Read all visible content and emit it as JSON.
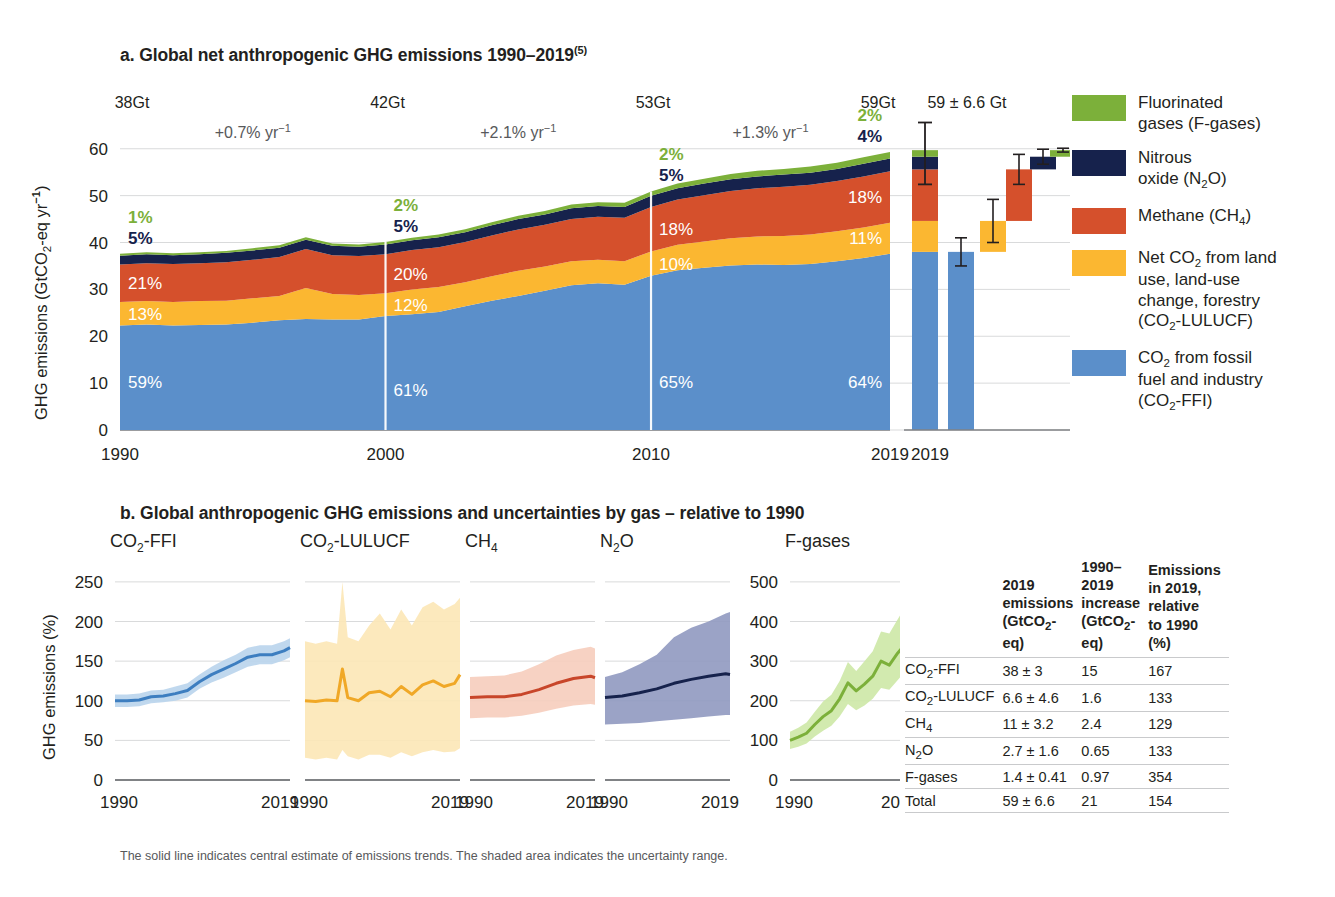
{
  "figure": {
    "panel_a": {
      "title": "a. Global net anthropogenic GHG emissions 1990–2019",
      "title_sup": "(5)",
      "ylabel_pre": "GHG emissions (GtCO",
      "ylabel_sub": "2",
      "ylabel_post": "-eq yr",
      "ylabel_sup": "−1",
      "ylabel_close": ")",
      "y_ticks": [
        "60",
        "50",
        "40",
        "30",
        "20",
        "10",
        "0"
      ],
      "x_ticks": [
        "1990",
        "2000",
        "2010",
        "2019"
      ],
      "totals": [
        {
          "year": "1990",
          "label": "38Gt"
        },
        {
          "year": "2000",
          "label": "42Gt"
        },
        {
          "year": "2010",
          "label": "53Gt"
        },
        {
          "year": "2019",
          "label": "59Gt"
        }
      ],
      "growth_rates": [
        {
          "label": "+0.7% yr",
          "sup": "−1"
        },
        {
          "label": "+2.1% yr",
          "sup": "−1"
        },
        {
          "label": "+1.3% yr",
          "sup": "−1"
        }
      ],
      "share_labels": {
        "1990": {
          "fgases": "1%",
          "n2o": "5%",
          "ch4": "21%",
          "lulucf": "13%",
          "ffi": "59%"
        },
        "2000": {
          "fgases": "2%",
          "n2o": "5%",
          "ch4": "20%",
          "lulucf": "12%",
          "ffi": "61%"
        },
        "2010": {
          "fgases": "2%",
          "n2o": "5%",
          "ch4": "18%",
          "lulucf": "10%",
          "ffi": "65%"
        },
        "2019": {
          "fgases": "2%",
          "n2o": "4%",
          "ch4": "18%",
          "lulucf": "11%",
          "ffi": "64%"
        }
      },
      "bar_panel": {
        "headline": "59 ± 6.6 Gt",
        "x_tick": "2019"
      }
    },
    "panel_b": {
      "title": "b. Global anthropogenic GHG emissions and uncertainties by gas – relative to 1990",
      "ylabel_text": "GHG emissions (%)",
      "subplots": [
        {
          "name": "CO2-FFI",
          "title_pre": "CO",
          "title_sub": "2",
          "title_post": "-FFI",
          "y_ticks": [
            "250",
            "200",
            "150",
            "100",
            "50",
            "0"
          ],
          "x_ticks": [
            "1990",
            "2019"
          ]
        },
        {
          "name": "CO2-LULUCF",
          "title_pre": "CO",
          "title_sub": "2",
          "title_post": "-LULUCF",
          "x_ticks": [
            "1990",
            "2019"
          ]
        },
        {
          "name": "CH4",
          "title_pre": "CH",
          "title_sub": "4",
          "title_post": "",
          "x_ticks": [
            "1990",
            "2019"
          ]
        },
        {
          "name": "N2O",
          "title_pre": "N",
          "title_sub": "2",
          "title_post": "O",
          "x_ticks": [
            "1990",
            "2019"
          ]
        },
        {
          "name": "F-gases",
          "title_pre": "F-gases",
          "title_sub": "",
          "title_post": "",
          "y_ticks": [
            "500",
            "400",
            "300",
            "200",
            "100",
            "0"
          ],
          "x_ticks": [
            "1990",
            "2019"
          ]
        }
      ]
    },
    "legend": [
      {
        "key": "fgases",
        "color": "#7cb03a",
        "line1": "Fluorinated",
        "line2": "gases (F-gases)",
        "line3": "",
        "line4": ""
      },
      {
        "key": "n2o",
        "color": "#16224c",
        "line1": "Nitrous",
        "line2": "oxide (N₂O)",
        "line3": "",
        "line4": ""
      },
      {
        "key": "ch4",
        "color": "#d5502c",
        "line1": "Methane (CH₄)",
        "line2": "",
        "line3": "",
        "line4": ""
      },
      {
        "key": "lulucf",
        "color": "#fbb731",
        "line1": "Net CO₂ from land",
        "line2": "use, land-use",
        "line3": "change, forestry",
        "line4": "(CO₂-LULUCF)"
      },
      {
        "key": "ffi",
        "color": "#5b8fca",
        "line1": "CO₂ from fossil",
        "line2": "fuel and industry",
        "line3": "(CO₂-FFI)",
        "line4": ""
      }
    ],
    "table": {
      "headers": [
        "",
        "2019 emissions (GtCO₂-eq)",
        "1990–2019 increase (GtCO₂-eq)",
        "Emissions in 2019, relative to 1990 (%)"
      ],
      "header_lines": [
        [
          ""
        ],
        [
          "2019",
          "emissions",
          "(GtCO₂-eq)"
        ],
        [
          "1990–2019",
          "increase",
          "(GtCO₂-eq)"
        ],
        [
          "Emissions",
          "in 2019,",
          "relative",
          "to 1990 (%)"
        ]
      ],
      "rows": [
        {
          "gas": "CO₂-FFI",
          "emissions_2019": "38 ± 3",
          "increase": "15",
          "relative": "167"
        },
        {
          "gas": "CO₂-LULUCF",
          "emissions_2019": "6.6 ± 4.6",
          "increase": "1.6",
          "relative": "133"
        },
        {
          "gas": "CH₄",
          "emissions_2019": "11 ± 3.2",
          "increase": "2.4",
          "relative": "129"
        },
        {
          "gas": "N₂O",
          "emissions_2019": "2.7 ± 1.6",
          "increase": "0.65",
          "relative": "133"
        },
        {
          "gas": "F-gases",
          "emissions_2019": "1.4 ± 0.41",
          "increase": "0.97",
          "relative": "354"
        },
        {
          "gas": "Total",
          "emissions_2019": "59 ± 6.6",
          "increase": "21",
          "relative": "154"
        }
      ]
    },
    "footnote": "The solid line indicates central estimate of emissions trends. The shaded area indicates the uncertainty range."
  },
  "chart_data": [
    {
      "id": "panel-a-stacked-area",
      "type": "area",
      "title": "a. Global net anthropogenic GHG emissions 1990–2019",
      "xlabel": "",
      "ylabel": "GHG emissions (GtCO2-eq yr-1)",
      "ylim": [
        0,
        64
      ],
      "xlim": [
        1990,
        2019
      ],
      "grid": true,
      "legend_position": "right",
      "x": [
        1990,
        1991,
        1992,
        1993,
        1994,
        1995,
        1996,
        1997,
        1998,
        1999,
        2000,
        2001,
        2002,
        2003,
        2004,
        2005,
        2006,
        2007,
        2008,
        2009,
        2010,
        2011,
        2012,
        2013,
        2014,
        2015,
        2016,
        2017,
        2018,
        2019
      ],
      "series": [
        {
          "name": "CO2 from fossil fuel and industry (CO2-FFI)",
          "color": "#5b8fca",
          "values": [
            22.3,
            22.5,
            22.3,
            22.4,
            22.5,
            22.9,
            23.4,
            23.7,
            23.6,
            23.6,
            24.3,
            24.7,
            25.2,
            26.4,
            27.6,
            28.6,
            29.7,
            30.9,
            31.3,
            31.0,
            32.9,
            34.1,
            34.6,
            35.1,
            35.3,
            35.2,
            35.4,
            36.0,
            36.7,
            37.6
          ]
        },
        {
          "name": "Net CO2 from land use, land-use change, forestry (CO2-LULUCF)",
          "color": "#fbb731",
          "values": [
            5.0,
            5.0,
            5.0,
            5.1,
            5.1,
            5.2,
            5.2,
            6.6,
            5.4,
            5.2,
            4.9,
            5.3,
            5.3,
            5.1,
            5.2,
            5.4,
            5.2,
            5.1,
            5.0,
            5.0,
            5.2,
            5.4,
            5.6,
            5.8,
            6.0,
            6.2,
            6.3,
            6.4,
            6.5,
            6.6
          ]
        },
        {
          "name": "Methane (CH4)",
          "color": "#d5502c",
          "values": [
            8.0,
            8.1,
            8.1,
            8.1,
            8.2,
            8.2,
            8.3,
            8.3,
            8.3,
            8.3,
            8.3,
            8.4,
            8.5,
            8.6,
            8.7,
            8.8,
            8.9,
            9.0,
            9.2,
            9.3,
            9.5,
            9.7,
            9.9,
            10.1,
            10.3,
            10.5,
            10.6,
            10.7,
            10.9,
            11.0
          ]
        },
        {
          "name": "Nitrous oxide (N2O)",
          "color": "#16224c",
          "values": [
            1.9,
            1.9,
            1.9,
            1.9,
            2.0,
            2.0,
            2.0,
            2.0,
            2.0,
            2.0,
            2.1,
            2.1,
            2.1,
            2.1,
            2.2,
            2.2,
            2.2,
            2.3,
            2.3,
            2.3,
            2.4,
            2.4,
            2.5,
            2.5,
            2.5,
            2.6,
            2.6,
            2.6,
            2.7,
            2.7
          ]
        },
        {
          "name": "Fluorinated gases (F-gases)",
          "color": "#7cb03a",
          "values": [
            0.4,
            0.4,
            0.4,
            0.4,
            0.4,
            0.5,
            0.5,
            0.5,
            0.5,
            0.5,
            0.5,
            0.5,
            0.6,
            0.6,
            0.6,
            0.7,
            0.7,
            0.8,
            0.8,
            0.9,
            0.9,
            1.0,
            1.0,
            1.1,
            1.2,
            1.2,
            1.3,
            1.3,
            1.4,
            1.4
          ]
        }
      ],
      "annotations": {
        "totals": [
          {
            "x": 1990,
            "label": "38Gt"
          },
          {
            "x": 2000,
            "label": "42Gt"
          },
          {
            "x": 2010,
            "label": "53Gt"
          },
          {
            "x": 2019,
            "label": "59Gt"
          }
        ],
        "growth": [
          {
            "span": "1990-2000",
            "label": "+0.7% yr-1"
          },
          {
            "span": "2000-2010",
            "label": "+2.1% yr-1"
          },
          {
            "span": "2010-2019",
            "label": "+1.3% yr-1"
          }
        ],
        "shares": {
          "1990": {
            "CO2-FFI": 59,
            "CO2-LULUCF": 13,
            "CH4": 21,
            "N2O": 5,
            "F-gases": 1
          },
          "2000": {
            "CO2-FFI": 61,
            "CO2-LULUCF": 12,
            "CH4": 20,
            "N2O": 5,
            "F-gases": 2
          },
          "2010": {
            "CO2-FFI": 65,
            "CO2-LULUCF": 10,
            "CH4": 18,
            "N2O": 5,
            "F-gases": 2
          },
          "2019": {
            "CO2-FFI": 64,
            "CO2-LULUCF": 11,
            "CH4": 18,
            "N2O": 4,
            "F-gases": 2
          }
        }
      }
    },
    {
      "id": "panel-a-waterfall",
      "type": "bar",
      "title": "59 ± 6.6 Gt",
      "xlabel": "2019",
      "ylim": [
        0,
        64
      ],
      "categories": [
        "Total",
        "CO2-FFI",
        "CO2-LULUCF",
        "CH4",
        "N2O",
        "F-gases"
      ],
      "values": [
        59,
        38,
        6.6,
        11,
        2.7,
        1.4
      ],
      "errors": [
        6.6,
        3,
        4.6,
        3.2,
        1.6,
        0.41
      ],
      "cumulative_base": [
        0,
        0,
        38,
        44.6,
        55.6,
        58.3
      ],
      "colors": [
        "stacked",
        "#5b8fca",
        "#fbb731",
        "#d5502c",
        "#16224c",
        "#7cb03a"
      ]
    },
    {
      "id": "panel-b-co2-ffi",
      "type": "line",
      "title": "CO2-FFI",
      "ylabel": "GHG emissions (%)",
      "ylim": [
        0,
        260
      ],
      "y_ticks": [
        0,
        50,
        100,
        150,
        200,
        250
      ],
      "xlim": [
        1990,
        2019
      ],
      "x_ticks": [
        1990,
        2019
      ],
      "color": "#3d7ec0",
      "band_color": "#b9d4ec",
      "x": [
        1990,
        1992,
        1994,
        1996,
        1998,
        2000,
        2002,
        2004,
        2006,
        2008,
        2010,
        2012,
        2014,
        2016,
        2018,
        2019
      ],
      "values": [
        100,
        100,
        101,
        105,
        106,
        109,
        113,
        124,
        133,
        140,
        147,
        155,
        158,
        158,
        163,
        167
      ],
      "upper": [
        108,
        108,
        109,
        113,
        114,
        118,
        122,
        133,
        143,
        151,
        158,
        167,
        170,
        170,
        175,
        179
      ],
      "lower": [
        92,
        92,
        93,
        97,
        98,
        100,
        104,
        115,
        123,
        129,
        136,
        143,
        146,
        146,
        151,
        155
      ]
    },
    {
      "id": "panel-b-co2-lulucf",
      "type": "line",
      "title": "CO2-LULUCF",
      "ylim": [
        0,
        260
      ],
      "xlim": [
        1990,
        2019
      ],
      "x_ticks": [
        1990,
        2019
      ],
      "color": "#f0a827",
      "band_color": "#fce7b6",
      "x": [
        1990,
        1992,
        1994,
        1996,
        1997,
        1998,
        2000,
        2002,
        2004,
        2006,
        2008,
        2010,
        2012,
        2014,
        2016,
        2018,
        2019
      ],
      "values": [
        100,
        99,
        101,
        100,
        140,
        104,
        100,
        110,
        112,
        105,
        118,
        108,
        120,
        125,
        118,
        122,
        133
      ],
      "upper": [
        175,
        172,
        175,
        172,
        250,
        180,
        175,
        195,
        210,
        190,
        215,
        195,
        218,
        225,
        215,
        222,
        230
      ],
      "lower": [
        28,
        26,
        28,
        26,
        38,
        30,
        26,
        32,
        32,
        28,
        35,
        30,
        35,
        38,
        35,
        36,
        40
      ]
    },
    {
      "id": "panel-b-ch4",
      "type": "line",
      "title": "CH4",
      "ylim": [
        0,
        260
      ],
      "xlim": [
        1990,
        2019
      ],
      "x_ticks": [
        1990,
        2019
      ],
      "color": "#c8462a",
      "band_color": "#f6cdbd",
      "x": [
        1990,
        1994,
        1998,
        2002,
        2006,
        2010,
        2014,
        2018,
        2019
      ],
      "values": [
        104,
        105,
        105,
        108,
        114,
        122,
        128,
        131,
        129
      ],
      "upper": [
        130,
        131,
        132,
        137,
        146,
        157,
        164,
        168,
        166
      ],
      "lower": [
        78,
        79,
        79,
        81,
        85,
        90,
        94,
        96,
        95
      ]
    },
    {
      "id": "panel-b-n2o",
      "type": "line",
      "title": "N2O",
      "ylim": [
        0,
        260
      ],
      "xlim": [
        1990,
        2019
      ],
      "x_ticks": [
        1990,
        2019
      ],
      "color": "#16224c",
      "band_color": "#9099c0",
      "x": [
        1990,
        1994,
        1998,
        2002,
        2006,
        2010,
        2014,
        2018,
        2019
      ],
      "values": [
        104,
        106,
        110,
        115,
        122,
        127,
        131,
        134,
        133
      ],
      "upper": [
        130,
        136,
        146,
        158,
        180,
        192,
        200,
        210,
        212
      ],
      "lower": [
        70,
        71,
        72,
        74,
        76,
        78,
        80,
        82,
        82
      ]
    },
    {
      "id": "panel-b-f-gases",
      "type": "line",
      "title": "F-gases",
      "ylim": [
        0,
        520
      ],
      "y_ticks": [
        0,
        100,
        200,
        300,
        400,
        500
      ],
      "xlim": [
        1990,
        2019
      ],
      "x_ticks": [
        1990,
        2019
      ],
      "color": "#7cb03a",
      "band_color": "#cde8a6",
      "x": [
        1990,
        1992,
        1994,
        1996,
        1998,
        2000,
        2002,
        2004,
        2006,
        2008,
        2010,
        2012,
        2014,
        2016,
        2018,
        2019
      ],
      "values": [
        100,
        108,
        118,
        140,
        160,
        175,
        205,
        245,
        225,
        242,
        262,
        300,
        290,
        320,
        345,
        354
      ],
      "upper": [
        122,
        132,
        145,
        172,
        198,
        215,
        250,
        298,
        275,
        300,
        325,
        375,
        370,
        405,
        440,
        460
      ],
      "lower": [
        78,
        84,
        92,
        110,
        124,
        137,
        160,
        192,
        176,
        188,
        205,
        232,
        228,
        252,
        275,
        250
      ]
    }
  ]
}
